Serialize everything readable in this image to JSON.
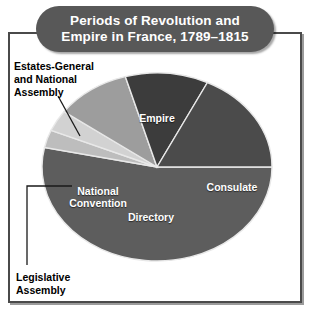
{
  "figure": {
    "title_line1": "Periods of Revolution and",
    "title_line2": "Empire in France, 1789–1815",
    "title_full": "Periods of Revolution and Empire in France, 1789–1815"
  },
  "labels": {
    "empire": "Empire",
    "consulate": "Consulate",
    "directory": "Directory",
    "national_convention": "National\nConvention",
    "estates_general": "Estates-General\nand National\nAssembly",
    "legislative_assembly": "Legislative\nAssembly"
  },
  "colors": {
    "title_pill": "#585858",
    "title_text": "#ffffff",
    "frame_border": "#4a4a4a",
    "background": "#ffffff",
    "empire": "#5d5d5d",
    "consulate": "#4b4b4b",
    "directory": "#3c3c3c",
    "national_convention": "#9d9d9d",
    "estates_general": "#bdbdbd",
    "legislative_assembly": "#d2d2d2",
    "slice_divider": "#e8e8e8",
    "leader_line": "#1a1a1a"
  },
  "chart_data": {
    "type": "pie",
    "title": "Periods of Revolution and Empire in France, 1789–1815",
    "subtitle": "",
    "xlabel": "",
    "ylabel": "",
    "legend_position": "labels-on-slices-and-callouts",
    "grid": false,
    "style": "3d-exploded-none",
    "units": "degrees of arc",
    "total_degrees": 360,
    "center_px": [
      157,
      167
    ],
    "radius_px": [
      115,
      94
    ],
    "depth_px": 20,
    "slices": [
      {
        "name": "Empire",
        "label": "Empire",
        "start_deg": 0,
        "end_deg": 192,
        "sweep_deg": 192,
        "share_pct": 53,
        "color": "#5d5d5d",
        "label_placement": "inside"
      },
      {
        "name": "Estates-General and National Assembly",
        "label": "Estates-General\nand National\nAssembly",
        "start_deg": 192,
        "end_deg": 203,
        "sweep_deg": 11,
        "share_pct": 3,
        "color": "#bdbdbd",
        "label_placement": "callout-upper-left"
      },
      {
        "name": "Legislative Assembly",
        "label": "Legislative\nAssembly",
        "start_deg": 203,
        "end_deg": 216,
        "sweep_deg": 13,
        "share_pct": 4,
        "color": "#d2d2d2",
        "label_placement": "callout-lower-left"
      },
      {
        "name": "National Convention",
        "label": "National\nConvention",
        "start_deg": 216,
        "end_deg": 254,
        "sweep_deg": 38,
        "share_pct": 11,
        "color": "#9d9d9d",
        "label_placement": "inside"
      },
      {
        "name": "Directory",
        "label": "Directory",
        "start_deg": 254,
        "end_deg": 296,
        "sweep_deg": 42,
        "share_pct": 12,
        "color": "#3c3c3c",
        "label_placement": "inside"
      },
      {
        "name": "Consulate",
        "label": "Consulate",
        "start_deg": 296,
        "end_deg": 360,
        "sweep_deg": 64,
        "share_pct": 18,
        "color": "#4b4b4b",
        "label_placement": "inside"
      }
    ],
    "categories": [
      "Empire",
      "Estates-General and National Assembly",
      "Legislative Assembly",
      "National Convention",
      "Directory",
      "Consulate"
    ],
    "values": [
      192,
      11,
      13,
      38,
      42,
      64
    ]
  }
}
